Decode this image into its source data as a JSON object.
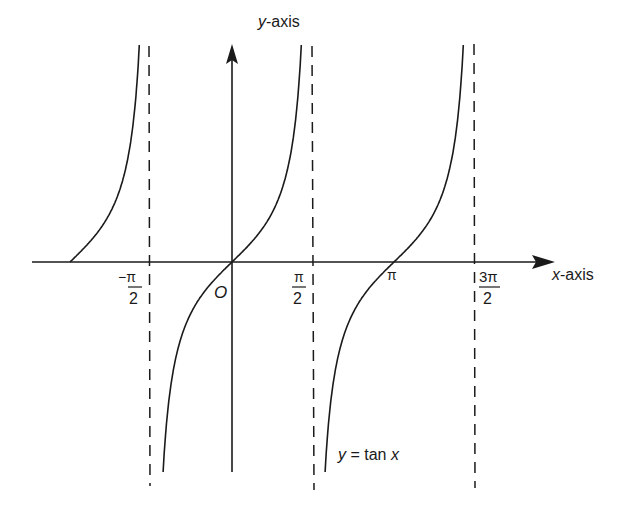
{
  "chart_data": {
    "type": "line",
    "title": "",
    "function": "y = tan x",
    "xlabel": "x-axis",
    "ylabel": "y-axis",
    "origin_label": "O",
    "x_ticks": [
      {
        "value": "-π/2",
        "num": "−π",
        "den": "2"
      },
      {
        "value": "π/2",
        "num": "π",
        "den": "2"
      },
      {
        "value": "π",
        "label": "π"
      },
      {
        "value": "3π/2",
        "num": "3π",
        "den": "2"
      }
    ],
    "asymptotes": [
      "-π/2",
      "π/2",
      "3π/2"
    ],
    "asymptote_style": "dashed",
    "branches": [
      {
        "interval": "(-3π/2, -π/2)",
        "visible_from_x": "-π",
        "zero_at": "-π"
      },
      {
        "interval": "(-π/2, π/2)",
        "zero_at": "0"
      },
      {
        "interval": "(π/2, 3π/2)",
        "zero_at": "π"
      }
    ],
    "grid": false,
    "legend": null,
    "curve_annotation": "y = tan x"
  },
  "labels": {
    "y_axis": "y-axis",
    "x_axis": "x-axis",
    "origin": "O",
    "neg_half_pi_num": "−π",
    "half_pi_num": "π",
    "pi": "π",
    "three_half_pi_num": "3π",
    "den": "2",
    "curve_y": "y",
    "curve_eq": " = tan ",
    "curve_x": "x"
  }
}
